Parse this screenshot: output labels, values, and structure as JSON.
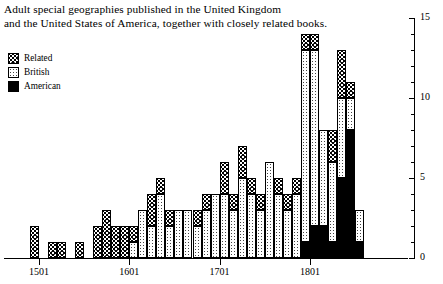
{
  "title": {
    "line1": "Adult special geographies published in the United Kingdom",
    "line2": "and the United States of America, together with closely related books."
  },
  "legend": {
    "items": [
      {
        "label": "Related",
        "key": "related",
        "pattern": "coarse-hatch"
      },
      {
        "label": "British",
        "key": "british",
        "pattern": "fine-dots"
      },
      {
        "label": "American",
        "key": "american",
        "pattern": "solid-black"
      }
    ]
  },
  "chart_data": {
    "type": "bar",
    "subtype": "stacked",
    "title": "Adult special geographies published in the United Kingdom and the United States of America, together with closely related books.",
    "xlabel": "",
    "ylabel": "",
    "xlim": [
      1491,
      1861
    ],
    "ylim": [
      0,
      15
    ],
    "yticks": [
      0,
      1,
      2,
      3,
      4,
      5,
      6,
      7,
      8,
      9,
      10,
      11,
      12,
      13,
      14,
      15
    ],
    "ytick_labels": [
      "0",
      "5",
      "10",
      "15"
    ],
    "ytick_label_values": [
      0,
      5,
      10,
      15
    ],
    "xticks": [
      1501,
      1601,
      1701,
      1801
    ],
    "xtick_labels": [
      "1501",
      "1601",
      "1701",
      "1801"
    ],
    "axis_position": {
      "y_axis": "right",
      "x_axis": "bottom"
    },
    "grid": false,
    "legend_position": "top-left",
    "bin_width_years": 10,
    "categories": [
      1491,
      1501,
      1511,
      1521,
      1531,
      1541,
      1551,
      1561,
      1571,
      1581,
      1591,
      1601,
      1611,
      1621,
      1631,
      1641,
      1651,
      1661,
      1671,
      1681,
      1691,
      1701,
      1711,
      1721,
      1731,
      1741,
      1751,
      1761,
      1771,
      1781,
      1791,
      1801,
      1811,
      1821,
      1831,
      1841,
      1851
    ],
    "series": [
      {
        "name": "American",
        "key": "american",
        "color": "#000000",
        "values": [
          0,
          0,
          0,
          0,
          0,
          0,
          0,
          0,
          0,
          0,
          0,
          0,
          0,
          0,
          0,
          0,
          0,
          0,
          0,
          0,
          0,
          0,
          0,
          0,
          0,
          0,
          0,
          0,
          0,
          0,
          1,
          2,
          2,
          1,
          5,
          8,
          1
        ]
      },
      {
        "name": "British",
        "key": "british",
        "color": "#d8d8d8",
        "values": [
          0,
          0,
          0,
          0,
          0,
          0,
          0,
          0,
          0,
          0,
          0,
          1,
          3,
          2,
          4,
          2,
          3,
          3,
          2,
          3,
          4,
          4,
          3,
          5,
          4,
          3,
          6,
          4,
          3,
          4,
          12,
          11,
          6,
          5,
          5,
          2,
          2
        ]
      },
      {
        "name": "Related",
        "key": "related",
        "color": "#b0b0b0",
        "values": [
          2,
          0,
          1,
          1,
          0,
          1,
          0,
          2,
          3,
          2,
          2,
          1,
          0,
          2,
          1,
          1,
          0,
          0,
          1,
          1,
          0,
          2,
          1,
          2,
          1,
          1,
          0,
          1,
          1,
          1,
          1,
          1,
          0,
          2,
          3,
          1,
          0
        ]
      }
    ],
    "totals": [
      2,
      0,
      1,
      1,
      0,
      1,
      0,
      2,
      3,
      2,
      2,
      2,
      3,
      4,
      5,
      3,
      3,
      3,
      3,
      4,
      4,
      6,
      4,
      7,
      5,
      4,
      6,
      5,
      4,
      5,
      14,
      14,
      8,
      8,
      13,
      11,
      3
    ]
  }
}
